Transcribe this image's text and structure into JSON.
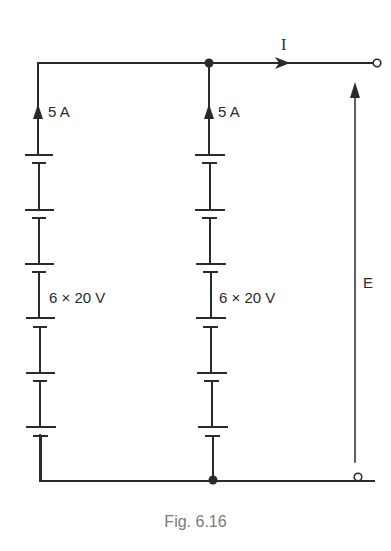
{
  "figure": {
    "caption": "Fig. 6.16"
  },
  "branches": [
    {
      "name": "left",
      "current_label": "5 A",
      "cells_label": "6 × 20 V",
      "cell_count": 6,
      "cell_voltage": "20 V"
    },
    {
      "name": "middle",
      "current_label": "5 A",
      "cells_label": "6 × 20 V",
      "cell_count": 6,
      "cell_voltage": "20 V"
    }
  ],
  "output": {
    "current_label": "I",
    "voltage_label": "E"
  },
  "colors": {
    "line": "#2a2a2a",
    "caption": "#7a7a7a",
    "background": "#ffffff"
  }
}
